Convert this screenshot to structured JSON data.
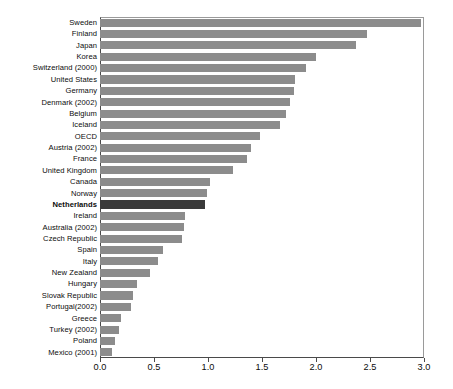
{
  "chart_data": {
    "type": "bar",
    "orientation": "horizontal",
    "title": "",
    "subtitle": "",
    "xlabel": "",
    "ylabel": "",
    "xlim": [
      0.0,
      3.0
    ],
    "xticks": [
      "0.0",
      "0.5",
      "1.0",
      "1.5",
      "2.0",
      "2.5",
      "3.0"
    ],
    "xtick_values": [
      0.0,
      0.5,
      1.0,
      1.5,
      2.0,
      2.5,
      3.0
    ],
    "grid": false,
    "legend": null,
    "bar_color": "#8c8c8c",
    "highlight_color": "#3a3a3a",
    "highlight_category": "Netherlands",
    "categories": [
      "Sweden",
      "Finland",
      "Japan",
      "Korea",
      "Switzerland (2000)",
      "United States",
      "Germany",
      "Denmark (2002)",
      "Belgium",
      "Iceland",
      "OECD",
      "Austria (2002)",
      "France",
      "United Kingdom",
      "Canada",
      "Norway",
      "Netherlands",
      "Ireland",
      "Australia (2002)",
      "Czech Republic",
      "Spain",
      "Italy",
      "New Zealand",
      "Hungary",
      "Slovak Republic",
      "Portugal(2002)",
      "Greece",
      "Turkey (2002)",
      "Poland",
      "Mexico (2001)"
    ],
    "values": [
      2.97,
      2.47,
      2.37,
      2.0,
      1.91,
      1.81,
      1.8,
      1.76,
      1.72,
      1.67,
      1.48,
      1.4,
      1.36,
      1.23,
      1.02,
      0.99,
      0.97,
      0.79,
      0.78,
      0.76,
      0.58,
      0.54,
      0.46,
      0.34,
      0.31,
      0.29,
      0.19,
      0.18,
      0.14,
      0.11
    ]
  }
}
